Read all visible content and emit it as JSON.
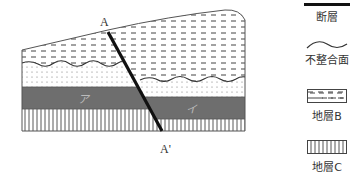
{
  "diagram": {
    "labels": {
      "fault_top": "A",
      "fault_bottom": "A'",
      "layer_left": "ア",
      "layer_right": "イ"
    },
    "colors": {
      "dark_layer": "#6e6e6e",
      "fault": "#111111",
      "outline": "#555555"
    }
  },
  "legend": {
    "items": [
      {
        "symbol": "thick-line",
        "label": "断層"
      },
      {
        "symbol": "wavy-line",
        "label": "不整合面"
      },
      {
        "symbol": "dash-pattern-box",
        "label": "地層B"
      },
      {
        "symbol": "vertical-stripe-box",
        "label": "地層C"
      }
    ]
  }
}
